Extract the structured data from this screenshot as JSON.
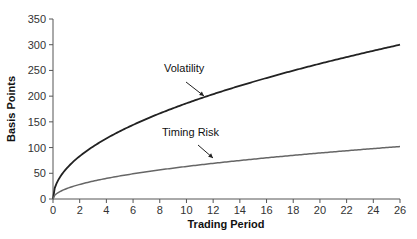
{
  "chart_data": {
    "type": "line",
    "title": "",
    "xlabel": "Trading Period",
    "ylabel": "Basis Points",
    "xlim": [
      0,
      26
    ],
    "ylim": [
      0,
      350
    ],
    "xticks": [
      0,
      2,
      4,
      6,
      8,
      10,
      12,
      14,
      16,
      18,
      20,
      22,
      24,
      26
    ],
    "yticks": [
      0,
      50,
      100,
      150,
      200,
      250,
      300,
      350
    ],
    "grid": false,
    "legend": "none (inline annotations with arrows)",
    "x": [
      0,
      0.5,
      1,
      2,
      4,
      6,
      8,
      10,
      12,
      14,
      16,
      18,
      20,
      22,
      24,
      26
    ],
    "series": [
      {
        "name": "Volatility",
        "color": "#222222",
        "values": [
          0,
          42,
          59,
          83,
          118,
          144,
          166,
          186,
          204,
          220,
          235,
          250,
          263,
          276,
          288,
          300
        ]
      },
      {
        "name": "Timing Risk",
        "color": "#666666",
        "values": [
          0,
          14,
          20,
          28,
          40,
          49,
          57,
          63,
          69,
          75,
          80,
          85,
          89,
          94,
          98,
          102
        ]
      }
    ],
    "annotations": [
      {
        "text": "Volatility",
        "target_x": 11,
        "target_y": 195
      },
      {
        "text": "Timing Risk",
        "target_x": 11.5,
        "target_y": 67
      }
    ]
  }
}
